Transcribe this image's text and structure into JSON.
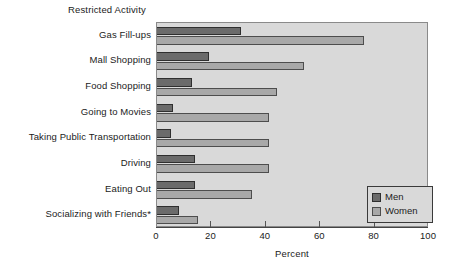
{
  "chart_data": {
    "type": "bar",
    "orientation": "horizontal",
    "title": "Restricted Activity",
    "xlabel": "Percent",
    "ylabel": "",
    "xlim": [
      0,
      100
    ],
    "xticks": [
      0,
      20,
      40,
      60,
      80,
      100
    ],
    "xticklabels": [
      "0",
      "20",
      "40",
      "60",
      "80",
      "100"
    ],
    "grid": false,
    "legend_position": "lower right",
    "categories": [
      "Gas Fill-ups",
      "Mall Shopping",
      "Food Shopping",
      "Going to Movies",
      "Taking Public Transportation",
      "Driving",
      "Eating Out",
      "Socializing with Friends*"
    ],
    "series": [
      {
        "name": "Men",
        "color": "#6b6b6b",
        "values": [
          31,
          19,
          13,
          6,
          5,
          14,
          14,
          8
        ]
      },
      {
        "name": "Women",
        "color": "#a8a8a8",
        "values": [
          76,
          54,
          44,
          41,
          41,
          41,
          35,
          15
        ]
      }
    ],
    "footnote": "*"
  },
  "legend": {
    "entries": [
      {
        "label": "Men",
        "swatch": "men"
      },
      {
        "label": "Women",
        "swatch": "women"
      }
    ]
  },
  "colors": {
    "men": "#6b6b6b",
    "women": "#a8a8a8",
    "plot_background": "#d9d9d9",
    "figure_background": "#ffffff"
  }
}
